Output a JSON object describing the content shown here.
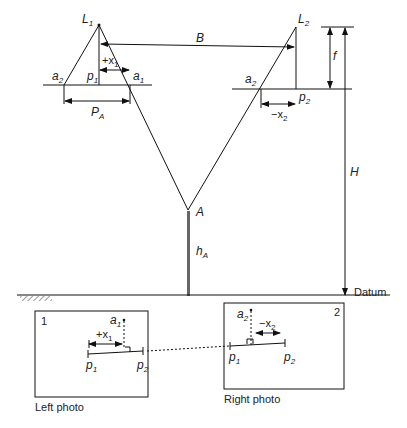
{
  "diagram": {
    "type": "stereo-parallax-geometry",
    "points": {
      "L1": "L",
      "L1_sub": "1",
      "L2": "L",
      "L2_sub": "2",
      "a1": "a",
      "a1_sub": "1",
      "a2": "a",
      "a2_sub": "2",
      "a2prime": "a",
      "a2prime_sub": "2",
      "p1": "p",
      "p1_sub": "1",
      "p2": "p",
      "p2_sub": "2",
      "A": "A"
    },
    "dimensions": {
      "B": "B",
      "f": "f",
      "H": "H",
      "hA": "h",
      "hA_sub": "A",
      "PA": "P",
      "PA_sub": "A",
      "plus_x1": "+x",
      "plus_x1_sub": "1",
      "minus_x2": "−x",
      "minus_x2_sub": "2"
    },
    "datum_label": "Datum",
    "left_photo": {
      "number": "1",
      "caption": "Left photo",
      "a1": "a",
      "a1_sub": "1",
      "plus_x1": "+x",
      "plus_x1_sub": "1",
      "p1": "p",
      "p1_sub": "1",
      "p2prime": "p",
      "p2prime_sub": "2"
    },
    "right_photo": {
      "number": "2",
      "caption": "Right photo",
      "a2": "a",
      "a2_sub": "2",
      "minus_x2": "−x",
      "minus_x2_sub": "2",
      "p1prime": "p",
      "p1prime_sub": "1",
      "p2": "p",
      "p2_sub": "2"
    }
  }
}
